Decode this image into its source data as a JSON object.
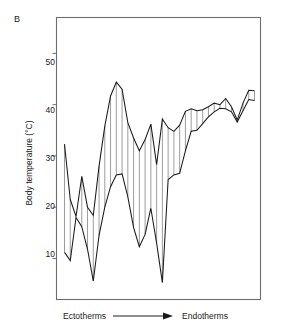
{
  "figure": {
    "panel_label": "B",
    "y_axis": {
      "label": "Body temperature (°C)",
      "ticks": [
        10,
        20,
        30,
        40,
        50
      ],
      "tick_labels": [
        "10",
        "20",
        "30",
        "40",
        "50"
      ],
      "range": [
        2,
        57
      ]
    },
    "x_axis": {
      "left_label": "Ectotherms",
      "arrow_glyph": "arrow-right",
      "right_label": "Endotherms",
      "ticks": [],
      "tick_labels": []
    },
    "colors": {
      "line": "#1a1a1a",
      "frame": "#6e6e6e",
      "hatch": "#4a4a4a",
      "background": "#ffffff"
    }
  },
  "chart_data": {
    "type": "line",
    "title": "",
    "subtitle": "",
    "xlabel": "Ectotherms → Endotherms",
    "ylabel": "Body temperature (°C)",
    "ylim": [
      2,
      57
    ],
    "xlim": [
      0,
      33
    ],
    "grid": false,
    "legend": "none",
    "annotations": [
      "B"
    ],
    "x": [
      0,
      1,
      2,
      3,
      4,
      5,
      6,
      7,
      8,
      9,
      10,
      11,
      12,
      13,
      14,
      15,
      16,
      17,
      18,
      19,
      20,
      21,
      22,
      23,
      24,
      25,
      26,
      27,
      28,
      29,
      30,
      31,
      32,
      33
    ],
    "series": [
      {
        "name": "Upper body temperature",
        "values": [
          32.3,
          21.5,
          18.2,
          26.0,
          20.0,
          18.4,
          28.0,
          35.8,
          41.7,
          44.4,
          43.0,
          36.5,
          33.5,
          31.0,
          33.2,
          36.2,
          28.3,
          37.2,
          35.5,
          34.8,
          36.0,
          38.7,
          39.2,
          38.8,
          39.0,
          39.6,
          40.3,
          40.0,
          41.2,
          39.6,
          37.0,
          40.3,
          42.8,
          42.7
        ]
      },
      {
        "name": "Lower body temperature",
        "values": [
          11.2,
          9.6,
          18.0,
          16.2,
          11.8,
          5.6,
          14.5,
          20.0,
          24.0,
          26.3,
          26.5,
          22.0,
          16.0,
          12.3,
          14.7,
          19.8,
          13.0,
          5.3,
          25.4,
          26.3,
          26.6,
          31.0,
          34.8,
          35.0,
          36.3,
          37.6,
          38.6,
          39.3,
          39.2,
          38.6,
          36.6,
          38.8,
          41.0,
          40.8
        ]
      }
    ],
    "hatch_stations": [
      0,
      1,
      2,
      3,
      4,
      5,
      6,
      7,
      8,
      9,
      10,
      11,
      12,
      13,
      14,
      15,
      16,
      17,
      18,
      19,
      20,
      21,
      22,
      23,
      24,
      25,
      26,
      27,
      28,
      29,
      30,
      31,
      32,
      33
    ]
  }
}
